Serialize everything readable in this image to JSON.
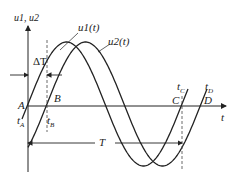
{
  "diagram": {
    "type": "two phase-shifted sine waveforms",
    "y_axis_label": "u1, u2",
    "x_axis_label": "t",
    "curves": [
      {
        "name": "u1(t)",
        "label": "u1(t)"
      },
      {
        "name": "u2(t)",
        "label": "u2(t)"
      }
    ],
    "points": {
      "A": "A",
      "B": "B",
      "C": "C",
      "D": "D"
    },
    "times": {
      "tA": "t",
      "tA_sub": "A",
      "tB": "t",
      "tB_sub": "B",
      "tC": "t",
      "tC_sub": "C",
      "tD": "t",
      "tD_sub": "D"
    },
    "annotations": {
      "delta_T": "ΔT",
      "period_T": "T"
    },
    "colors": {
      "line": "#222222",
      "background": "#ffffff"
    }
  }
}
